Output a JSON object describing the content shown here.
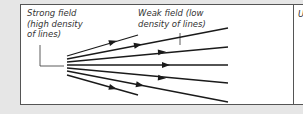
{
  "figure": {
    "labels": {
      "strong_field": "Strong field\n(high density\nof lines)",
      "weak_field": "Weak field (low\ndensity of lines)",
      "next_panel_initial": "U"
    },
    "field_lines": [
      {
        "from": [
          67,
          56
        ],
        "to": [
          138,
          35
        ],
        "arrow_at": [
          113,
          42
        ]
      },
      {
        "from": [
          67,
          59
        ],
        "to": [
          228,
          28
        ],
        "arrow_at": [
          138,
          45
        ]
      },
      {
        "from": [
          67,
          62
        ],
        "to": [
          228,
          47
        ],
        "arrow_at": [
          162,
          52
        ]
      },
      {
        "from": [
          67,
          65
        ],
        "to": [
          228,
          65
        ],
        "arrow_at": [
          166,
          65
        ]
      },
      {
        "from": [
          67,
          68
        ],
        "to": [
          228,
          83
        ],
        "arrow_at": [
          162,
          78
        ]
      },
      {
        "from": [
          67,
          71
        ],
        "to": [
          228,
          102
        ],
        "arrow_at": [
          140,
          85
        ]
      },
      {
        "from": [
          67,
          75
        ],
        "to": [
          138,
          95
        ],
        "arrow_at": [
          113,
          88
        ]
      }
    ],
    "colors": {
      "line": "#1a1a1a",
      "border": "#555555",
      "background": "#e6e6e6",
      "panel": "#ffffff"
    }
  }
}
